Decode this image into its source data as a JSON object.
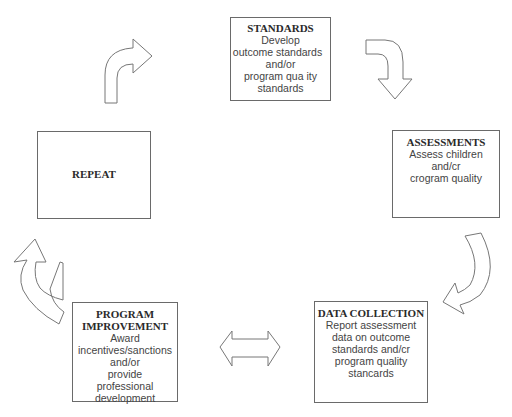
{
  "diagram": {
    "nodes": {
      "standards": {
        "title": "STANDARDS",
        "lines": [
          "Develop",
          "outcome standards",
          "and/or",
          "program qua ity",
          "standards"
        ]
      },
      "assessments": {
        "title": "ASSESSMENTS",
        "lines": [
          "Assess children",
          "and/cr",
          "crogram quality"
        ]
      },
      "data_collection": {
        "title": "DATA COLLECTION",
        "lines": [
          "Report assessment",
          "data on outcome",
          "standards and/cr",
          "program quality",
          "stancards"
        ]
      },
      "program_improvement": {
        "title_lines": [
          "PROGRAM",
          "IMPROVEMENT"
        ],
        "lines": [
          "Award",
          "incentives/sanctions",
          "and/or",
          "provide",
          "professional",
          "development"
        ]
      },
      "repeat": {
        "title": "REPEAT"
      }
    },
    "edges": [
      {
        "from": "repeat",
        "to": "standards",
        "type": "curved-arrow"
      },
      {
        "from": "standards",
        "to": "assessments",
        "type": "curved-arrow"
      },
      {
        "from": "assessments",
        "to": "data_collection",
        "type": "curved-arrow"
      },
      {
        "from": "data_collection",
        "to": "program_improvement",
        "type": "double-arrow"
      },
      {
        "from": "program_improvement",
        "to": "repeat",
        "type": "curved-arrow"
      }
    ]
  }
}
